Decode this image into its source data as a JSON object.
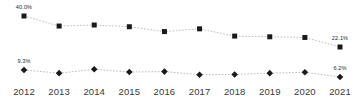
{
  "chart_data": {
    "type": "line",
    "title": "",
    "subtitle": "",
    "xlabel": "",
    "ylabel": "",
    "grid": false,
    "legend": "none",
    "categories": [
      "2012",
      "2013",
      "2014",
      "2015",
      "2016",
      "2017",
      "2018",
      "2019",
      "2020",
      "2021"
    ],
    "ylim": [
      0,
      44
    ],
    "series": [
      {
        "name": "upper-series",
        "marker": "square",
        "line_style": "dotted",
        "color": "#1a1a1a",
        "values": [
          40.0,
          34.2,
          34.8,
          33.8,
          31.0,
          32.6,
          28.4,
          28.0,
          27.6,
          22.1
        ],
        "labels": [
          {
            "index": 0,
            "text": "40.0%"
          },
          {
            "index": 9,
            "text": "22.1%"
          }
        ]
      },
      {
        "name": "lower-series",
        "marker": "diamond",
        "line_style": "dotted",
        "color": "#1a1a1a",
        "values": [
          9.3,
          7.9,
          9.6,
          8.4,
          8.6,
          7.2,
          7.3,
          7.9,
          8.3,
          6.2
        ],
        "labels": [
          {
            "index": 0,
            "text": "9.3%"
          },
          {
            "index": 9,
            "text": "6.2%"
          }
        ]
      }
    ]
  },
  "axis": {
    "ticks": [
      "2012",
      "2013",
      "2014",
      "2015",
      "2016",
      "2017",
      "2018",
      "2019",
      "2020",
      "2021"
    ]
  },
  "labels": {
    "upper_first": "40.0%",
    "upper_last": "22.1%",
    "lower_first": "9.3%",
    "lower_last": "6.2%"
  },
  "colors": {
    "marker": "#1a1a1a",
    "line": "#b4b4b4",
    "axis_text": "#3a3a3a",
    "label_text": "#2b2b2b",
    "background": "#ffffff"
  }
}
